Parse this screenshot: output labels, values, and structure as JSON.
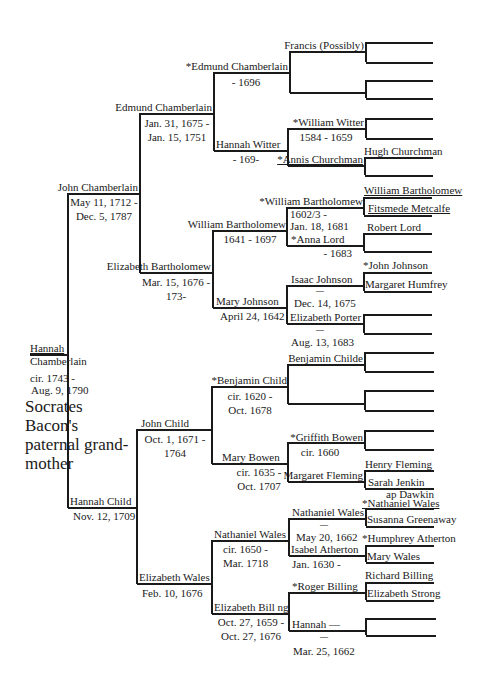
{
  "title": "Socrates Bacon's paternal grand-mother",
  "root": {
    "name_line1": "Hannah",
    "name_line2": "Chamberlain",
    "dates_line1": "cir. 1743 -",
    "dates_line2": "Aug. 9, 1790"
  },
  "gen2": {
    "father": {
      "name": "John Chamberlain",
      "dates_line1": "May 11, 1712 -",
      "dates_line2": "Dec. 5, 1787"
    },
    "mother": {
      "name": "Hannah Child",
      "dates_line1": "Nov. 12, 1709"
    }
  },
  "gen3": {
    "ff": {
      "name": "Edmund Chamberlain",
      "dates_line1": "Jan. 31, 1675 -",
      "dates_line2": "Jan. 15, 1751"
    },
    "fm": {
      "name": "Elizabeth Bartholomew",
      "dates_line1": "Mar. 15, 1676 -",
      "dates_line2": "173-"
    },
    "mf": {
      "name": "John Child",
      "dates_line1": "Oct. 1, 1671 -",
      "dates_line2": "1764"
    },
    "mm": {
      "name": "Elizabeth Wales",
      "dates_line1": "Feb. 10, 1676"
    }
  },
  "gen4": {
    "fff": {
      "name": "*Edmund Chamberlain",
      "dates_line1": "- 1696"
    },
    "ffm": {
      "name": "Hannah Witter",
      "dates_line1": "- 169-"
    },
    "fmf": {
      "name": "William Bartholomew",
      "dates_line1": "1641 - 1697"
    },
    "fmm": {
      "name": "Mary Johnson",
      "dates_line1": "April 24, 1642"
    },
    "mff": {
      "name": "*Benjamin Child",
      "dates_line1": "cir. 1620 -",
      "dates_line2": "Oct. 1678"
    },
    "mfm": {
      "name": "Mary Bowen",
      "dates_line1": "cir. 1635 -",
      "dates_line2": "Oct. 1707"
    },
    "mmf": {
      "name": "Nathaniel Wales",
      "dates_line1": "cir. 1650 -",
      "dates_line2": "Mar. 1718"
    },
    "mmm": {
      "name": "Elizabeth Bill ng",
      "dates_line1": "Oct. 27, 1659 -",
      "dates_line2": "Oct. 27, 1676"
    }
  },
  "gen5": {
    "p1": {
      "name": "Francis (Possibly)"
    },
    "p2": {
      "name": ""
    },
    "p3": {
      "name": "*William Witter",
      "dates_line1": "1584 - 1659"
    },
    "p4": {
      "name": "*Annis Churchman"
    },
    "p5": {
      "name": "*William Bartholomew",
      "dates_line1": "1602/3 -",
      "dates_line2": "Jan. 18, 1681"
    },
    "p6": {
      "name": "*Anna Lord",
      "dates_line1": "- 1683"
    },
    "p7": {
      "name": "Isaac Johnson",
      "dash": "—",
      "dates_line1": "Dec. 14, 1675"
    },
    "p8": {
      "name": "Elizabeth Porter",
      "dash": "—",
      "dates_line1": "Aug. 13, 1683"
    },
    "p9": {
      "name": "Benjamin Childe"
    },
    "p10": {
      "name": ""
    },
    "p11": {
      "name": "*Griffith Bowen",
      "dates_line1": "cir. 1660"
    },
    "p12": {
      "name": "Margaret Fleming"
    },
    "p13": {
      "name": "Nathaniel Wales",
      "dash": "—",
      "dates_line1": "May 20, 1662"
    },
    "p14": {
      "name": "Isabel Atherton",
      "dates_line1": "Jan. 1630 -"
    },
    "p15": {
      "name": "*Roger Billing"
    },
    "p16": {
      "name": "Hannah —",
      "dash": "—",
      "dates_line1": "Mar. 25, 1662"
    }
  },
  "gen6": [
    "",
    "",
    "",
    "",
    "",
    "",
    "Hugh Churchman",
    "",
    "William Bartholomew",
    "Fitsmede Metcalfe",
    "Robert Lord",
    "",
    "*John Johnson",
    "Margaret Humfrey",
    "",
    "",
    "",
    "",
    "",
    "",
    "",
    "",
    "Henry Fleming",
    "Sarah Jenkin ap Dawkin",
    "*Nathaniel Wales",
    "Susanna Greenaway",
    "*Humphrey Atherton",
    "Mary Wales",
    "Richard Billing",
    "Elizabeth Strong",
    "",
    ""
  ],
  "gen6_labels": {
    "hugh": "Hugh Churchman",
    "wb": "William Bartholomew",
    "fm": "Fitsmede Metcalfe",
    "rl": "Robert Lord",
    "jj": "*John Johnson",
    "mh": "Margaret Humfrey",
    "hf": "Henry Fleming",
    "sj": "Sarah Jenkin",
    "sj2": "ap Dawkin",
    "nw": "*Nathaniel Wales",
    "sg": "Susanna Greenaway",
    "ha": "*Humphrey Atherton",
    "mw": "Mary Wales",
    "rb": "Richard Billing",
    "es": "Elizabeth Strong"
  }
}
